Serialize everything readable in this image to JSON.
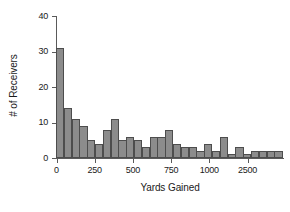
{
  "chart_data": {
    "type": "bar",
    "title": "",
    "xlabel": "Yards Gained",
    "ylabel": "# of Receivers",
    "grid": false,
    "legend": "none",
    "ylim": [
      0,
      40
    ],
    "ytick_values": [
      0,
      10,
      20,
      30,
      40
    ],
    "ytick_labels": [
      "0",
      "10",
      "20",
      "30",
      "40"
    ],
    "xtick_labels": [
      "0",
      "250",
      "500",
      "750",
      "1000",
      "2500"
    ],
    "xtick_positions": [
      0,
      1,
      2,
      3,
      4,
      5
    ],
    "note": "Histogram of receiving yards; x-axis tick labels are spaced evenly but the last interval (1000 to 2500) is compressed as printed.",
    "bin_count": 29,
    "categories": [
      "bin-1",
      "bin-2",
      "bin-3",
      "bin-4",
      "bin-5",
      "bin-6",
      "bin-7",
      "bin-8",
      "bin-9",
      "bin-10",
      "bin-11",
      "bin-12",
      "bin-13",
      "bin-14",
      "bin-15",
      "bin-16",
      "bin-17",
      "bin-18",
      "bin-19",
      "bin-20",
      "bin-21",
      "bin-22",
      "bin-23",
      "bin-24",
      "bin-25",
      "bin-26",
      "bin-27",
      "bin-28",
      "bin-29"
    ],
    "values": [
      31,
      14,
      11,
      9,
      5,
      4,
      8,
      11,
      5,
      6,
      5,
      3,
      6,
      6,
      8,
      4,
      3,
      3,
      2,
      4,
      2,
      6,
      1,
      3,
      1,
      2,
      2,
      2,
      2
    ]
  },
  "axes": {
    "x_title": "Yards Gained",
    "y_title": "# of Receivers"
  }
}
